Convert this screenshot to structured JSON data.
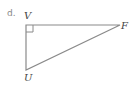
{
  "item_label": "d.",
  "triangle": {
    "vertices": [
      {
        "name": "V",
        "x": 26,
        "y": 25,
        "right_angle": true
      },
      {
        "name": "F",
        "x": 120,
        "y": 25
      },
      {
        "name": "U",
        "x": 26,
        "y": 70
      }
    ],
    "labels": {
      "V": "V",
      "F": "F",
      "U": "U"
    },
    "stroke_color": "#8a8a8a",
    "right_angle_marker_size": 7
  }
}
